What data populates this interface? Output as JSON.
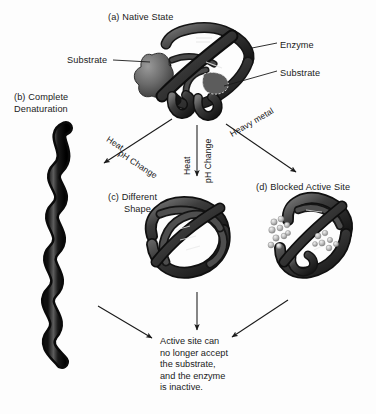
{
  "figure": {
    "background_color": "#fdfdfd",
    "ink_color": "#1a1a1a",
    "protein_color": "#2b2b2b",
    "substrate_color": "#6e6e6e",
    "metal_bead_color": "#b9b9b9"
  },
  "panels": {
    "a": {
      "caption": "(a) Native State"
    },
    "b": {
      "caption": "(b) Complete\nDenaturation"
    },
    "c": {
      "caption": "(c) Different\n      Shape"
    },
    "d": {
      "caption": "(d) Blocked Active Site"
    }
  },
  "callouts": {
    "enzyme": "Enzyme",
    "substrate_left": "Substrate",
    "substrate_right": "Substrate"
  },
  "arrows": {
    "left": {
      "line1": "Heat",
      "line2": "pH Change"
    },
    "middle": {
      "line1": "Heat",
      "line2": "pH Change"
    },
    "right": {
      "line1": "Heavy metal"
    }
  },
  "conclusion": {
    "text": "Active site can\nno longer accept\nthe substrate,\nand the enzyme\nis inactive."
  }
}
